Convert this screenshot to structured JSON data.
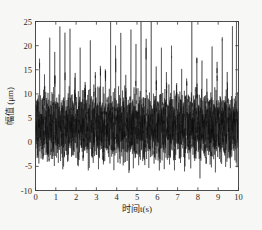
{
  "chart_data": {
    "type": "line",
    "title": "",
    "xlabel": "时间t(s)",
    "ylabel": "幅值 (μm)",
    "xlim": [
      0,
      10
    ],
    "ylim": [
      -10,
      25
    ],
    "xticks": [
      0,
      1,
      2,
      3,
      4,
      5,
      6,
      7,
      8,
      9,
      10
    ],
    "xtick_labels": [
      "0",
      "1",
      "2",
      "3",
      "4",
      "5",
      "6",
      "7",
      "8",
      "9",
      "10"
    ],
    "yticks": [
      -10,
      -5,
      0,
      5,
      10,
      15,
      20,
      25
    ],
    "ytick_labels": [
      "-10",
      "-5",
      "0",
      "5",
      "10",
      "15",
      "20",
      "25"
    ],
    "grid": false,
    "legend": null,
    "legend_position": "none",
    "series": [
      {
        "name": "振动幅值",
        "color": "#111111",
        "description": "dense high-frequency vibration signal with periodic impulse spikes",
        "baseline_mean": 3.2,
        "dense_band_min": -4.5,
        "dense_band_max": 10.5,
        "carrier_frequency_hz": 46,
        "modulation_frequency_hz": 4.0,
        "impulse_period_s": 0.25,
        "impulse_peaks": [
          {
            "t": 0.2,
            "value": 12.0
          },
          {
            "t": 0.45,
            "value": 11.4
          },
          {
            "t": 0.7,
            "value": 14.9
          },
          {
            "t": 0.95,
            "value": 18.7
          },
          {
            "t": 1.2,
            "value": 20.6
          },
          {
            "t": 1.45,
            "value": 23.5
          },
          {
            "t": 1.7,
            "value": 20.4
          },
          {
            "t": 1.95,
            "value": 16.6
          },
          {
            "t": 2.2,
            "value": 17.2
          },
          {
            "t": 2.45,
            "value": 14.6
          },
          {
            "t": 2.7,
            "value": 18.2
          },
          {
            "t": 2.95,
            "value": 18.5
          },
          {
            "t": 3.2,
            "value": 15.9
          },
          {
            "t": 3.45,
            "value": 19.6
          },
          {
            "t": 3.7,
            "value": 23.4
          },
          {
            "t": 3.95,
            "value": 22.1
          },
          {
            "t": 4.2,
            "value": 16.4
          },
          {
            "t": 4.45,
            "value": 13.4
          },
          {
            "t": 4.7,
            "value": 18.6
          },
          {
            "t": 4.95,
            "value": 19.9
          },
          {
            "t": 5.2,
            "value": 21.6
          },
          {
            "t": 5.45,
            "value": 23.9
          },
          {
            "t": 5.7,
            "value": 18.0
          },
          {
            "t": 5.95,
            "value": 16.2
          },
          {
            "t": 6.2,
            "value": 15.0
          },
          {
            "t": 6.45,
            "value": 17.4
          },
          {
            "t": 6.7,
            "value": 20.3
          },
          {
            "t": 6.95,
            "value": 16.3
          },
          {
            "t": 7.2,
            "value": 13.1
          },
          {
            "t": 7.45,
            "value": 18.3
          },
          {
            "t": 7.7,
            "value": 21.0
          },
          {
            "t": 7.95,
            "value": 20.3
          },
          {
            "t": 8.2,
            "value": 15.2
          },
          {
            "t": 8.45,
            "value": 12.4
          },
          {
            "t": 8.7,
            "value": 17.0
          },
          {
            "t": 8.95,
            "value": 17.3
          },
          {
            "t": 9.2,
            "value": 15.4
          },
          {
            "t": 9.45,
            "value": 14.7
          },
          {
            "t": 9.7,
            "value": 18.5
          },
          {
            "t": 9.9,
            "value": 19.7
          }
        ],
        "negative_troughs": [
          {
            "t": 0.6,
            "value": -4.2
          },
          {
            "t": 1.35,
            "value": -4.4
          },
          {
            "t": 2.1,
            "value": -4.0
          },
          {
            "t": 2.6,
            "value": -4.3
          },
          {
            "t": 3.35,
            "value": -4.5
          },
          {
            "t": 3.85,
            "value": -4.6
          },
          {
            "t": 4.6,
            "value": -4.1
          },
          {
            "t": 5.35,
            "value": -5.4
          },
          {
            "t": 6.1,
            "value": -4.3
          },
          {
            "t": 6.85,
            "value": -4.0
          },
          {
            "t": 7.35,
            "value": -5.2
          },
          {
            "t": 8.1,
            "value": -4.4
          },
          {
            "t": 8.85,
            "value": -4.2
          },
          {
            "t": 9.6,
            "value": -4.5
          }
        ]
      }
    ]
  }
}
